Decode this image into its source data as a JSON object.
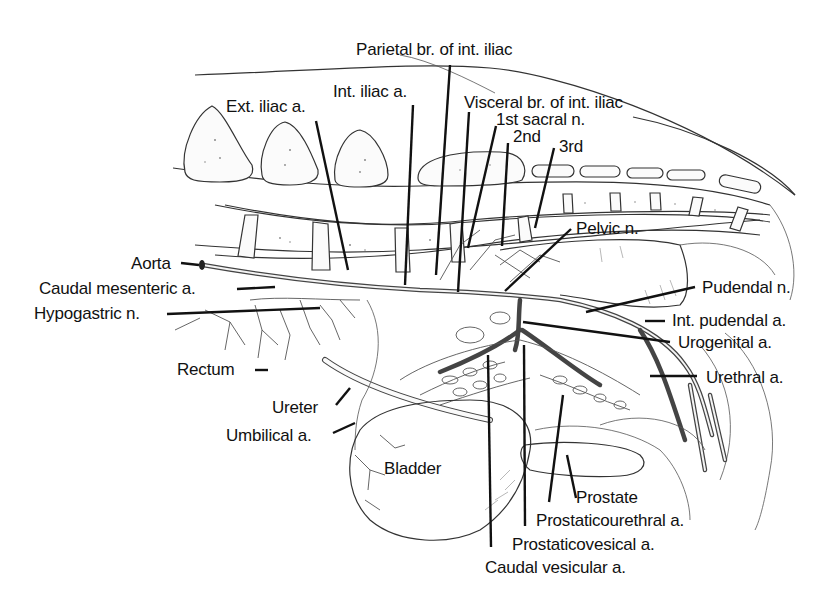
{
  "figure": {
    "type": "anatomical illustration",
    "colors": {
      "ink": "#111111",
      "background": "#ffffff"
    }
  },
  "labels": {
    "parietal_br": "Parietal br. of int. iliac",
    "int_iliac": "Int. iliac a.",
    "ext_iliac": "Ext. iliac a.",
    "visceral_br": "Visceral br. of int. iliac",
    "sacral_1": "1st sacral n.",
    "sacral_2": "2nd",
    "sacral_3": "3rd",
    "aorta": "Aorta",
    "caudal_mesenteric": "Caudal mesenteric a.",
    "hypogastric": "Hypogastric n.",
    "pelvic_n": "Pelvic n.",
    "pudendal_n": "Pudendal n.",
    "int_pudendal": "Int. pudendal a.",
    "urogenital": "Urogenital a.",
    "urethral": "Urethral a.",
    "rectum": "Rectum",
    "ureter": "Ureter",
    "umbilical": "Umbilical a.",
    "bladder": "Bladder",
    "prostate": "Prostate",
    "prostaticourethral": "Prostaticourethral a.",
    "prostaticovesical": "Prostaticovesical a.",
    "caudal_vesicular": "Caudal vesicular a."
  }
}
